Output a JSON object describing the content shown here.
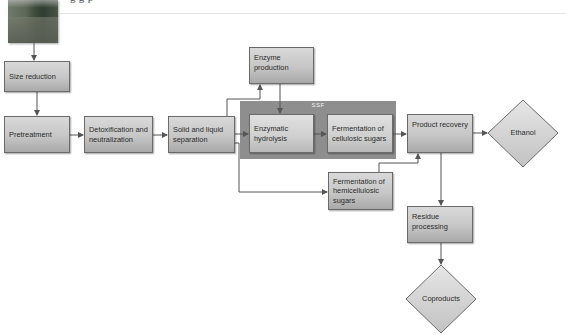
{
  "header": {
    "cut_off_caption": "g        g                                                                                                    p"
  },
  "photo": {
    "icon": "biomass-photo"
  },
  "ssf_group": {
    "label": "SSF"
  },
  "nodes": {
    "size_reduction": "Size reduction",
    "pretreatment": "Pretreatment",
    "detoxification": "Detoxification and neutralization",
    "solid_liquid": "Solid and liquid separation",
    "enzyme_production": "Enzyme production",
    "enzymatic_hydrolysis": "Enzymatic hydrolysis",
    "fermentation_cellulosic": "Fermentation of cellulosic sugars",
    "fermentation_hemicellulosic": "Fermentation of hemicellulosic sugars",
    "product_recovery": "Product recovery",
    "residue_processing": "Residue processing",
    "ethanol": "Ethanol",
    "coproducts": "Coproducts"
  },
  "colors": {
    "box_fill_top": "#d9d9d9",
    "box_fill_bottom": "#a9a9a9",
    "ssf_band": "#8e8e8e",
    "line": "#555555",
    "diamond_fill": "#d4d4d4"
  }
}
